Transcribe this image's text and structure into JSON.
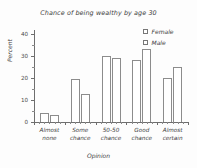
{
  "chart_data": {
    "type": "bar",
    "title": "Chance of being wealthy by age 30",
    "xlabel": "Opinion",
    "ylabel": "Percent",
    "categories": [
      "Almost none",
      "Some chance",
      "50-50 chance",
      "Good chance",
      "Almost certain"
    ],
    "category_lines": [
      [
        "Almost",
        "none"
      ],
      [
        "Some",
        "chance"
      ],
      [
        "50-50",
        "chance"
      ],
      [
        "Good",
        "chance"
      ],
      [
        "Almost",
        "certain"
      ]
    ],
    "series": [
      {
        "name": "Female",
        "values": [
          4,
          19.5,
          30,
          28.5,
          20
        ]
      },
      {
        "name": "Male",
        "values": [
          3,
          13,
          29,
          33.5,
          25
        ]
      }
    ],
    "ylim": [
      0,
      42
    ],
    "yticks": [
      0,
      10,
      20,
      30,
      40
    ],
    "ytick_labels": [
      "0",
      "10",
      "20",
      "30",
      "40"
    ],
    "yminor_ticks": [
      5,
      15,
      25,
      35
    ],
    "grid": false,
    "legend_position": "top-right",
    "bar_fill_color": "#ffffff",
    "bar_edge_color": "#8c8c8c",
    "axis_color": "#6e6e6e",
    "text_color": "#3c3c3c",
    "background_color": "#fdfdfd"
  },
  "legend": {
    "entries": [
      {
        "label": "Female",
        "swatch": "open-square-marker"
      },
      {
        "label": "Male",
        "swatch": "open-square-marker"
      }
    ]
  }
}
